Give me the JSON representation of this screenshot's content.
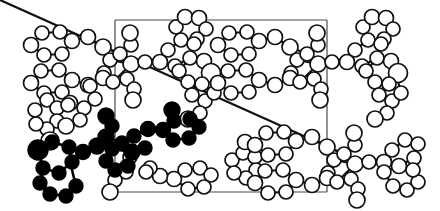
{
  "figure": {
    "kind": "crystal-packing-diagram",
    "title": "",
    "caption": "",
    "background_color": "#ffffff",
    "width": 440,
    "height": 211,
    "atom_styles": {
      "open_fill": "#ffffff",
      "open_stroke": "#111111",
      "highlight_fill": "#000000",
      "highlight_stroke": "#000000",
      "bond_color": "#111111",
      "cell_edge_color": "#4a4a4a"
    }
  },
  "unit_cell": {
    "label": "",
    "x": 115,
    "y": 20,
    "width": 212,
    "height": 172,
    "corners": [
      [
        115,
        20
      ],
      [
        327,
        20
      ],
      [
        327,
        192
      ],
      [
        115,
        192
      ]
    ]
  },
  "chart_data": {
    "type": "scatter",
    "title": "",
    "xlabel": "",
    "ylabel": "",
    "grid": false,
    "legend": [],
    "xlim": [
      0,
      440
    ],
    "ylim": [
      0,
      211
    ],
    "counts": {
      "highlighted_atoms": 31,
      "open_atoms": 196,
      "total_atoms": 227
    },
    "molecule_units": [
      {
        "name": "molecule-highlighted",
        "style": "filled",
        "position": [
          150,
          150
        ]
      },
      {
        "name": "molecule-open-upper-left",
        "style": "open",
        "position": [
          120,
          70
        ]
      },
      {
        "name": "molecule-open-upper-right",
        "style": "open",
        "position": [
          320,
          70
        ]
      },
      {
        "name": "molecule-open-lower-right",
        "style": "open",
        "position": [
          320,
          150
        ]
      }
    ]
  }
}
